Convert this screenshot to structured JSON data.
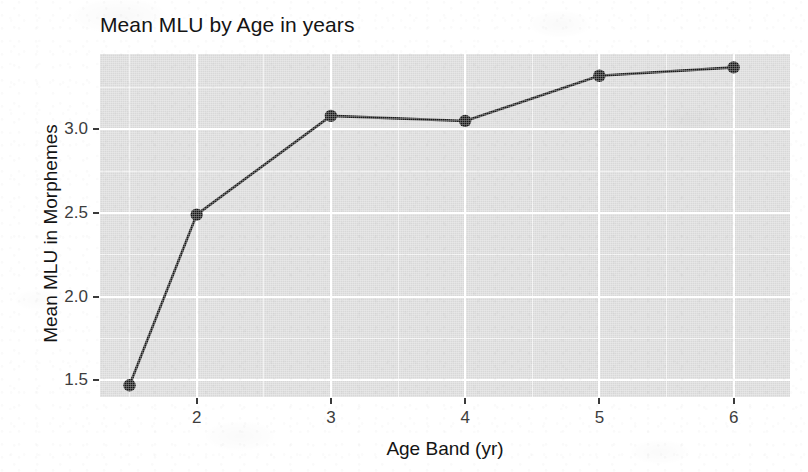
{
  "chart_data": {
    "type": "line",
    "title": "Mean MLU by Age in years",
    "xlabel": "Age Band (yr)",
    "ylabel": "Mean MLU in Morphemes",
    "x": [
      1.5,
      2,
      3,
      4,
      5,
      6
    ],
    "values": [
      1.47,
      2.49,
      3.08,
      3.05,
      3.32,
      3.37
    ],
    "series": [
      {
        "name": "Mean MLU",
        "values": [
          1.47,
          2.49,
          3.08,
          3.05,
          3.32,
          3.37
        ]
      }
    ],
    "xlim": [
      1.28,
      6.42
    ],
    "ylim": [
      1.4,
      3.45
    ],
    "x_tick_labels": [
      "2",
      "3",
      "4",
      "5",
      "6"
    ],
    "x_tick_values": [
      2,
      3,
      4,
      5,
      6
    ],
    "y_tick_labels": [
      "1.5",
      "2.0",
      "2.5",
      "3.0"
    ],
    "y_tick_values": [
      1.5,
      2.0,
      2.5,
      3.0
    ],
    "y_minor_tick_values": [
      1.75,
      2.25,
      2.75,
      3.25
    ],
    "x_minor_tick_values": [
      1.5,
      2.5,
      3.5,
      4.5,
      5.5,
      6.5
    ],
    "grid": true,
    "legend": "none",
    "marker": "filled-circle",
    "line_color": "#191919",
    "point_color": "#151515",
    "panel_color": "#d8d8d8",
    "grid_color": "#ffffff",
    "background_color": "#ffffff"
  },
  "figure": {
    "title": "Mean MLU by Age in years",
    "x_axis_title": "Age Band (yr)",
    "y_axis_title": "Mean MLU in Morphemes"
  }
}
